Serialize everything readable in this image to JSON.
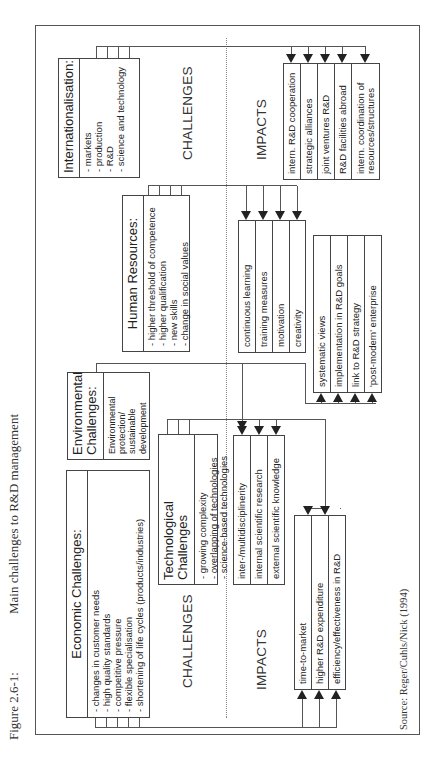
{
  "figure": {
    "number": "Figure 2.6-1:",
    "title": "Main challenges to R&D management",
    "source": "Source: Reger/Cuhls/Nick (1994)"
  },
  "section_labels": {
    "challenges_left": "CHALLENGES",
    "challenges_right": "CHALLENGES",
    "impacts_left": "IMPACTS",
    "impacts_right": "IMPACTS"
  },
  "challenges": {
    "economic": {
      "title": "Economic Challenges:",
      "items": [
        "- changes in customer needs",
        "- high quality standards",
        "- competitive pressure",
        "- flexible specialisation",
        "- shortening of life cycles (products/industries)"
      ]
    },
    "environmental": {
      "title_line1": "Environmental",
      "title_line2": "Challenges:",
      "items": [
        "Environmental",
        "protection/",
        "sustainable",
        "development"
      ]
    },
    "technological": {
      "title": "Technological Challenges",
      "items": [
        "- growing complexity",
        "- overlapping of technologies",
        "- science-based technologies"
      ]
    },
    "human_resources": {
      "title": "Human Resources:",
      "items": [
        "- higher threshold of competence",
        "- higher qualification",
        "- new skills",
        "- change in social values"
      ]
    },
    "internationalisation": {
      "title": "Internationalisation:",
      "items": [
        "- markets",
        "- production",
        "- R&D",
        "- science and technology"
      ]
    }
  },
  "impacts": {
    "economic": [
      "time-to-market",
      "higher R&D expenditure",
      "efficiency/effectiveness in R&D"
    ],
    "technological": [
      "inter-/multidisciplinerity",
      "internal scientific research",
      "external scientific knowledge"
    ],
    "human_resources": [
      "continuous learning",
      "training measures",
      "motivation",
      "creativity"
    ],
    "systemic": [
      "systematic views",
      "implementation in R&D goals",
      "link to R&D strategy",
      "'post-modern' enterprise"
    ],
    "internationalisation": [
      "intern. R&D cooperation",
      "strategic alliances",
      "joint ventures   R&D",
      "R&D facilities abroad",
      "intern. coordination of resources/structures"
    ]
  }
}
